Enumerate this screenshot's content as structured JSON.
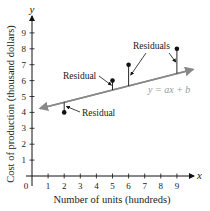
{
  "chart_data": {
    "type": "scatter",
    "title": "",
    "xlabel": "Number of units (hundreds)",
    "ylabel": "Cost of production (thousand dollars)",
    "x_axis_letter": "x",
    "y_axis_letter": "y",
    "origin_label": "0",
    "xlim": [
      0,
      10
    ],
    "ylim": [
      0,
      10
    ],
    "x_ticks": [
      1,
      2,
      3,
      4,
      5,
      6,
      7,
      8,
      9
    ],
    "y_ticks": [
      1,
      2,
      3,
      4,
      5,
      6,
      7,
      8,
      9
    ],
    "grid": false,
    "points": [
      {
        "x": 2,
        "y": 4
      },
      {
        "x": 5,
        "y": 6
      },
      {
        "x": 6,
        "y": 7
      },
      {
        "x": 9,
        "y": 8
      }
    ],
    "regression_line": {
      "label": "y = ax + b",
      "start": {
        "x": 0.5,
        "y": 4.25
      },
      "end": {
        "x": 10,
        "y": 6.7
      },
      "color": "#888888"
    },
    "annotations": [
      {
        "text": "Residual",
        "points_to": [
          5
        ]
      },
      {
        "text": "Residual",
        "points_to": [
          2
        ]
      },
      {
        "text": "Residuals",
        "points_to": [
          6,
          9
        ]
      }
    ]
  }
}
